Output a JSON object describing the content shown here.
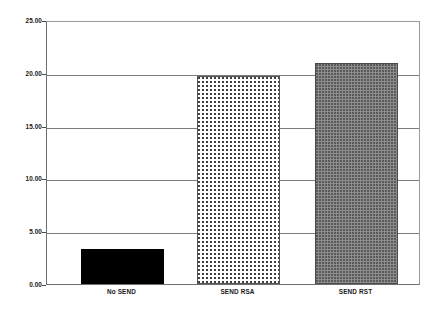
{
  "chart_data": {
    "type": "bar",
    "title": "",
    "subtitle": "",
    "xlabel": "",
    "ylabel": "ping RTT (ms)",
    "categories": [
      "No SEND",
      "SEND RSA",
      "SEND RST"
    ],
    "values": [
      3.3,
      19.7,
      20.9
    ],
    "series": [
      {
        "name": "ping RTT",
        "values": [
          3.3,
          19.7,
          20.9
        ]
      }
    ],
    "ylim": [
      0.0,
      25.0
    ],
    "ytick_values": [
      0.0,
      5.0,
      10.0,
      15.0,
      20.0,
      25.0
    ],
    "ytick_labels": [
      "0.00",
      "5.00",
      "10.00",
      "15.00",
      "20.00",
      "25.00"
    ],
    "grid": true,
    "grid_axis": "y",
    "legend": false,
    "legend_position": "none",
    "bar_styles": [
      {
        "category": "No SEND",
        "fill": "solid-black",
        "color": "#000000"
      },
      {
        "category": "SEND RSA",
        "fill": "fine-dotted-on-white",
        "color": "#ffffff"
      },
      {
        "category": "SEND RST",
        "fill": "gray-dotted",
        "color": "#8d8d8d"
      }
    ],
    "plot_background": "#ffffff",
    "axis_color": "#6f6f6f",
    "gridline_color": "#7d7d7d",
    "text_color": "#1a1a1a"
  }
}
